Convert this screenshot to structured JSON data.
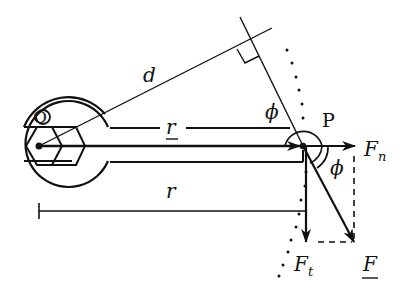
{
  "diagram": {
    "type": "torque wrench force decomposition",
    "labels": {
      "origin": "O",
      "point": "P",
      "lever_arm": "d",
      "position_vector": "r",
      "distance": "r",
      "angle_top": "ϕ",
      "angle_right": "ϕ",
      "normal_force": "F",
      "normal_force_sub": "n",
      "tangential_force": "F",
      "tangential_force_sub": "t",
      "force": "F"
    },
    "colors": {
      "ink": "#111111",
      "background": "#ffffff"
    }
  }
}
